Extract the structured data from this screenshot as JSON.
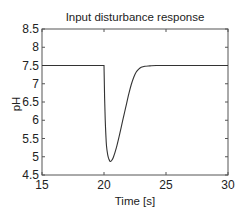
{
  "chart_data": {
    "type": "line",
    "title": "Input disturbance response",
    "xlabel": "Time [s]",
    "ylabel": "pH",
    "xlim": [
      15,
      30
    ],
    "ylim": [
      4.5,
      8.5
    ],
    "xticks": [
      15,
      20,
      25,
      30
    ],
    "xtick_labels": [
      "15",
      "20",
      "25",
      "30"
    ],
    "yticks": [
      4.5,
      5,
      5.5,
      6,
      6.5,
      7,
      7.5,
      8,
      8.5
    ],
    "ytick_labels": [
      "4.5",
      "5",
      "5.5",
      "6",
      "6.5",
      "7",
      "7.5",
      "8",
      "8.5"
    ],
    "grid": false,
    "legend": null,
    "series": [
      {
        "name": "pH",
        "color": "#333333",
        "x": [
          15,
          20.0,
          20.05,
          20.1,
          20.15,
          20.2,
          20.3,
          20.4,
          20.5,
          20.6,
          20.75,
          21.0,
          21.25,
          21.5,
          21.75,
          22.0,
          22.2,
          22.4,
          22.6,
          22.8,
          23.0,
          23.3,
          23.7,
          24.2,
          25,
          30
        ],
        "values": [
          7.5,
          7.5,
          6.6,
          6.0,
          5.6,
          5.3,
          5.05,
          4.93,
          4.87,
          4.89,
          4.98,
          5.25,
          5.6,
          5.98,
          6.35,
          6.72,
          6.98,
          7.18,
          7.32,
          7.4,
          7.45,
          7.48,
          7.49,
          7.5,
          7.5,
          7.5
        ]
      }
    ]
  }
}
